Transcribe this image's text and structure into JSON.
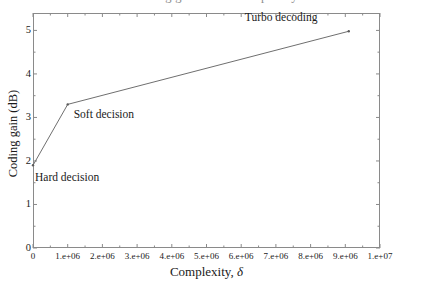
{
  "figure": {
    "clipped_title": "Coding gain versus complexity",
    "frame_color": "#8a8a8a",
    "line_color": "#6f6f6f",
    "text_color": "#1a1a1a"
  },
  "chart_data": {
    "type": "line",
    "title": "Coding gain versus complexity",
    "xlabel": "Complexity, δ",
    "xlabel_text": "Complexity,",
    "xlabel_symbol": "δ",
    "ylabel": "Coding gain (dB)",
    "xlim": [
      0,
      10000000
    ],
    "ylim": [
      0,
      5.4
    ],
    "grid": false,
    "legend": "none",
    "x_tick_labels": [
      "0",
      "1.e+06",
      "2.e+06",
      "3.e+06",
      "4.e+06",
      "5.e+06",
      "6.e+06",
      "7.e+06",
      "8.e+06",
      "9.e+06",
      "1.e+07"
    ],
    "x_tick_values": [
      0,
      1000000,
      2000000,
      3000000,
      4000000,
      5000000,
      6000000,
      7000000,
      8000000,
      9000000,
      10000000
    ],
    "y_tick_labels": [
      "0",
      "1",
      "2",
      "3",
      "4",
      "5"
    ],
    "y_tick_values": [
      0,
      1,
      2,
      3,
      4,
      5
    ],
    "x": [
      0,
      1000000,
      9100000
    ],
    "values": [
      1.9,
      3.3,
      4.98
    ],
    "points": [
      {
        "label": "Hard decision",
        "x": 0,
        "y": 1.9
      },
      {
        "label": "Soft decision",
        "x": 1000000,
        "y": 3.3
      },
      {
        "label": "Turbo decoding",
        "x": 9100000,
        "y": 4.98
      }
    ],
    "annotations": [
      "Hard decision",
      "Soft decision",
      "Turbo decoding"
    ]
  }
}
